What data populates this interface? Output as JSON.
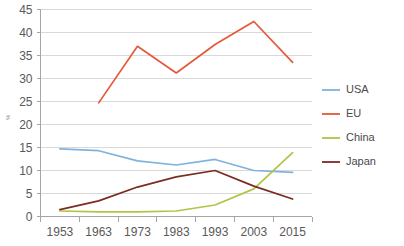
{
  "chart_data": {
    "type": "line",
    "title": "",
    "xlabel": "",
    "ylabel": "%",
    "categories": [
      "1953",
      "1963",
      "1973",
      "1983",
      "1993",
      "2003",
      "2015"
    ],
    "x": [
      1953,
      1963,
      1973,
      1983,
      1993,
      2003,
      2015
    ],
    "ylim": [
      0,
      45
    ],
    "yticks": [
      0,
      5,
      10,
      15,
      20,
      25,
      30,
      35,
      40,
      45
    ],
    "ytick_labels": [
      "0",
      "5",
      "10",
      "15",
      "20",
      "25",
      "30",
      "35",
      "40",
      "45"
    ],
    "grid": true,
    "legend_position": "right",
    "series": [
      {
        "name": "USA",
        "color": "#7FB2DD",
        "values": [
          14.7,
          14.3,
          12.1,
          11.2,
          12.4,
          10.0,
          9.6
        ]
      },
      {
        "name": "EU",
        "color": "#E4593A",
        "values": [
          null,
          24.7,
          37.0,
          31.2,
          37.4,
          42.4,
          33.5
        ]
      },
      {
        "name": "China",
        "color": "#AFC545",
        "values": [
          1.2,
          1.0,
          1.0,
          1.2,
          2.5,
          6.0,
          13.9
        ]
      },
      {
        "name": "Japan",
        "color": "#7B2C23",
        "values": [
          1.5,
          3.4,
          6.4,
          8.6,
          10.0,
          6.6,
          3.8
        ]
      }
    ]
  },
  "legend": {
    "items": [
      {
        "label": "USA",
        "color": "#7FB2DD"
      },
      {
        "label": "EU",
        "color": "#E4593A"
      },
      {
        "label": "China",
        "color": "#AFC545"
      },
      {
        "label": "Japan",
        "color": "#7B2C23"
      }
    ]
  },
  "axes": {
    "y_axis_label": "%",
    "y_tick_labels": [
      "45",
      "40",
      "35",
      "30",
      "25",
      "20",
      "15",
      "10",
      "5",
      "0"
    ],
    "x_tick_labels": [
      "1953",
      "1963",
      "1973",
      "1983",
      "1993",
      "2003",
      "2015"
    ]
  }
}
